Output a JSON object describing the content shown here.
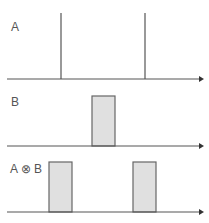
{
  "diagram": {
    "colors": {
      "line": "#555555",
      "rect_fill": "#e0e0e0",
      "rect_stroke": "#666666"
    },
    "panels": [
      {
        "label": "A",
        "type": "impulses",
        "axis_y": 79,
        "impulses": [
          {
            "x": 61,
            "top": 13
          },
          {
            "x": 145,
            "top": 13
          }
        ]
      },
      {
        "label": "B",
        "type": "rectangles",
        "axis_y": 146,
        "rects": [
          {
            "x": 92,
            "width": 23,
            "top": 96
          }
        ]
      },
      {
        "label": "A ⊗ B",
        "type": "rectangles",
        "axis_y": 212,
        "rects": [
          {
            "x": 49,
            "width": 23,
            "top": 162
          },
          {
            "x": 133,
            "width": 23,
            "top": 162
          }
        ]
      }
    ]
  }
}
